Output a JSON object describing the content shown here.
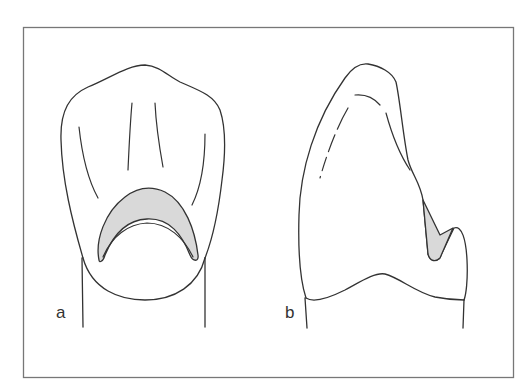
{
  "figure": {
    "panels": [
      {
        "id": "a",
        "label": "a",
        "view": "lingual view with shaded cingulum area"
      },
      {
        "id": "b",
        "label": "b",
        "view": "proximal view with shaded lingual area"
      }
    ]
  },
  "colors": {
    "line": "#333333",
    "frame": "#777777",
    "shade_fill": "#d9d9d9",
    "background": "#ffffff"
  }
}
